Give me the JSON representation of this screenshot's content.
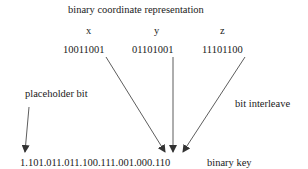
{
  "title": "binary coordinate representation",
  "coordinates": [
    {
      "axis": "x",
      "bits": "10011001"
    },
    {
      "axis": "y",
      "bits": "01101001"
    },
    {
      "axis": "z",
      "bits": "11101100"
    }
  ],
  "labels": {
    "placeholder": "placeholder bit",
    "interleave": "bit interleave",
    "key_label": "binary key"
  },
  "binary_key": "1.101.011.011.100.111.001.000.110"
}
